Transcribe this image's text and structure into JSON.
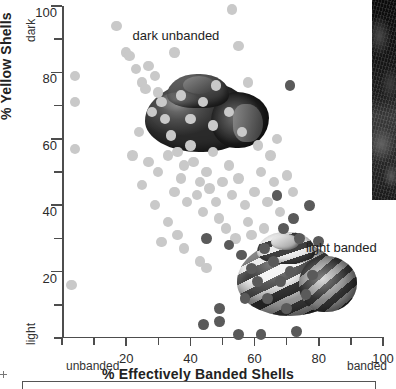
{
  "chart_data": {
    "type": "scatter",
    "title": "",
    "xlabel": "% Effectively Banded Shells",
    "ylabel": "% Yellow Shells",
    "xlim": [
      0,
      100
    ],
    "ylim": [
      0,
      100
    ],
    "grid": false,
    "legend_position": "none",
    "x_ticks": [
      0,
      10,
      20,
      30,
      40,
      50,
      60,
      70,
      80,
      90,
      100
    ],
    "x_tick_labels": [
      "",
      "",
      "20",
      "",
      "40",
      "",
      "60",
      "",
      "80",
      "",
      "100"
    ],
    "y_ticks": [
      0,
      10,
      20,
      30,
      40,
      50,
      60,
      70,
      80,
      90,
      100
    ],
    "y_tick_labels": [
      "",
      "",
      "20",
      "",
      "40",
      "",
      "60",
      "",
      "80",
      "",
      "100"
    ],
    "axis_end_labels": {
      "x_low": "unbanded",
      "x_high": "banded",
      "y_low": "light",
      "y_high": "dark"
    },
    "annotations": [
      {
        "name": "dark-unbanded-label",
        "text": "dark unbanded",
        "x": 22,
        "y": 91
      },
      {
        "name": "light-banded-label",
        "text": "light banded",
        "x": 76,
        "y": 27
      }
    ],
    "series": [
      {
        "name": "light-morph-points",
        "color": "#c9c9c9",
        "marker": "circle",
        "points": [
          [
            4,
            79
          ],
          [
            4,
            71
          ],
          [
            4,
            57
          ],
          [
            3,
            16
          ],
          [
            17,
            94
          ],
          [
            20,
            86
          ],
          [
            21,
            85
          ],
          [
            23,
            81
          ],
          [
            25,
            77
          ],
          [
            26,
            75
          ],
          [
            27,
            82
          ],
          [
            29,
            79
          ],
          [
            30,
            74
          ],
          [
            31,
            71
          ],
          [
            28,
            68
          ],
          [
            32,
            66
          ],
          [
            24,
            62
          ],
          [
            34,
            61
          ],
          [
            22,
            55
          ],
          [
            27,
            53
          ],
          [
            30,
            50
          ],
          [
            33,
            55
          ],
          [
            36,
            56
          ],
          [
            38,
            52
          ],
          [
            40,
            58
          ],
          [
            41,
            53
          ],
          [
            37,
            48
          ],
          [
            43,
            47
          ],
          [
            35,
            44
          ],
          [
            39,
            41
          ],
          [
            42,
            43
          ],
          [
            45,
            50
          ],
          [
            47,
            56
          ],
          [
            46,
            45
          ],
          [
            44,
            38
          ],
          [
            48,
            41
          ],
          [
            50,
            47
          ],
          [
            52,
            52
          ],
          [
            49,
            36
          ],
          [
            53,
            43
          ],
          [
            55,
            48
          ],
          [
            57,
            40
          ],
          [
            51,
            33
          ],
          [
            54,
            30
          ],
          [
            33,
            35
          ],
          [
            36,
            31
          ],
          [
            31,
            29
          ],
          [
            38,
            27
          ],
          [
            43,
            23
          ],
          [
            45,
            21
          ],
          [
            29,
            40
          ],
          [
            25,
            46
          ],
          [
            58,
            35
          ],
          [
            60,
            44
          ],
          [
            62,
            50
          ],
          [
            64,
            41
          ],
          [
            66,
            47
          ],
          [
            68,
            38
          ],
          [
            59,
            31
          ],
          [
            63,
            33
          ],
          [
            56,
            62
          ],
          [
            61,
            58
          ],
          [
            65,
            55
          ],
          [
            70,
            49
          ],
          [
            72,
            44
          ],
          [
            67,
            60
          ],
          [
            52,
            68
          ],
          [
            47,
            64
          ],
          [
            44,
            71
          ],
          [
            40,
            66
          ],
          [
            37,
            73
          ],
          [
            48,
            76
          ],
          [
            55,
            88
          ],
          [
            58,
            77
          ],
          [
            53,
            99
          ],
          [
            35,
            86
          ]
        ]
      },
      {
        "name": "dark-morph-points",
        "color": "#5a5a5a",
        "marker": "circle",
        "points": [
          [
            45,
            30
          ],
          [
            52,
            28
          ],
          [
            56,
            25
          ],
          [
            59,
            21
          ],
          [
            63,
            27
          ],
          [
            66,
            23
          ],
          [
            61,
            17
          ],
          [
            68,
            17
          ],
          [
            71,
            20
          ],
          [
            64,
            12
          ],
          [
            57,
            12
          ],
          [
            70,
            9
          ],
          [
            49,
            9
          ],
          [
            55,
            1
          ],
          [
            62,
            1
          ],
          [
            73,
            2
          ],
          [
            76,
            13
          ],
          [
            78,
            19
          ],
          [
            74,
            30
          ],
          [
            69,
            33
          ],
          [
            72,
            36
          ],
          [
            67,
            43
          ],
          [
            80,
            29
          ],
          [
            77,
            40
          ],
          [
            71,
            76
          ],
          [
            49,
            5
          ],
          [
            44,
            4
          ]
        ]
      }
    ]
  },
  "illustrations": [
    {
      "name": "dark-unbanded-shell",
      "caption": "dark unbanded"
    },
    {
      "name": "light-banded-shell",
      "caption": "light banded"
    }
  ],
  "photo_strip": {
    "name": "snail-habitat-photo-strip",
    "description": ""
  }
}
